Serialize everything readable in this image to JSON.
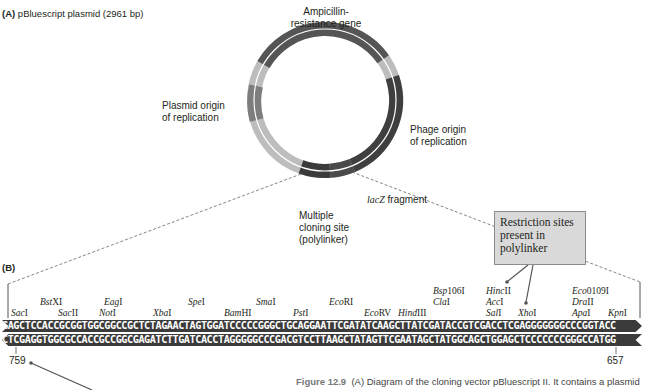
{
  "panel_a": {
    "label": "(A)",
    "title": "pBluescript plasmid (2961 bp)",
    "features": {
      "ampicillin": "Ampicillin-\nresistance gene",
      "ampicillin_line1": "Ampicillin-",
      "ampicillin_line2": "resistance gene",
      "plasmid_ori_line1": "Plasmid origin",
      "plasmid_ori_line2": "of replication",
      "phage_ori_line1": "Phage origin",
      "phage_ori_line2": "of replication",
      "lacz_italic": "lacZ",
      "lacz_rest": " fragment",
      "mcs_line1": "Multiple",
      "mcs_line2": "cloning site",
      "mcs_line3": "(polylinker)"
    },
    "colors": {
      "dark": "#4a4a4a",
      "medium": "#7d7d7d",
      "light": "#bdbdbd"
    }
  },
  "panel_b": {
    "label": "(B)",
    "callout": {
      "line1": "Restriction sites",
      "line2": "present in",
      "line3": "polylinker"
    },
    "top_strand": "GAGCTCCACCGCGGTGGCGGCCGCTCTAGAACTAGTGGATCCCCCGGGCTGCAGGAATTCGATATCAAGCTTATCGATACCGTCGACCTCGAGGGGGGGCCCGGTACC",
    "bottom_strand": "CTCGAGGTGGCGCCACCGCCGGCGAGATCTTGATCACCTAGGGGGCCCGACGTCCTTAAGCTATAGTTCGAATAGCTATGGCAGCTGGAGCTCCCCCCCGGGCCATGG",
    "enzymes": [
      {
        "italic": "Sac",
        "rest": "I"
      },
      {
        "italic": "Bst",
        "rest": "XI"
      },
      {
        "italic": "Sac",
        "rest": "II"
      },
      {
        "italic": "Eag",
        "rest": "I"
      },
      {
        "italic": "Not",
        "rest": "I"
      },
      {
        "italic": "Xba",
        "rest": "I"
      },
      {
        "italic": "Spe",
        "rest": "I"
      },
      {
        "italic": "Bam",
        "rest": "HI"
      },
      {
        "italic": "Sma",
        "rest": "I"
      },
      {
        "italic": "Pst",
        "rest": "I"
      },
      {
        "italic": "Eco",
        "rest": "RI"
      },
      {
        "italic": "Eco",
        "rest": "RV"
      },
      {
        "italic": "Hind",
        "rest": "III"
      },
      {
        "italic": "Bsp",
        "rest": "106I"
      },
      {
        "italic": "Cla",
        "rest": "I"
      },
      {
        "italic": "Hinc",
        "rest": "II"
      },
      {
        "italic": "Acc",
        "rest": "I"
      },
      {
        "italic": "Sal",
        "rest": "I"
      },
      {
        "italic": "Xho",
        "rest": "I"
      },
      {
        "italic": "Eco",
        "rest": "0109I"
      },
      {
        "italic": "Dra",
        "rest": "II"
      },
      {
        "italic": "Apa",
        "rest": "I"
      },
      {
        "italic": "Kpn",
        "rest": "I"
      }
    ],
    "position_left": "759",
    "position_right": "657"
  },
  "caption": {
    "figure": "Figure 12.9",
    "text": "(A) Diagram of the cloning vector pBluescript II. It contains a plasmid"
  }
}
